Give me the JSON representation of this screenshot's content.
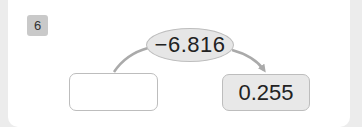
{
  "problem": {
    "number": "6",
    "operation_label": "−6.816",
    "input_value": "",
    "output_value": "0.255"
  },
  "colors": {
    "badge": "#c9c9c9",
    "ellipse_fill": "#e6e6e6",
    "result_box_fill": "#e8e8e8",
    "stroke": "#bdbdbd",
    "arc": "#aaaaaa"
  }
}
